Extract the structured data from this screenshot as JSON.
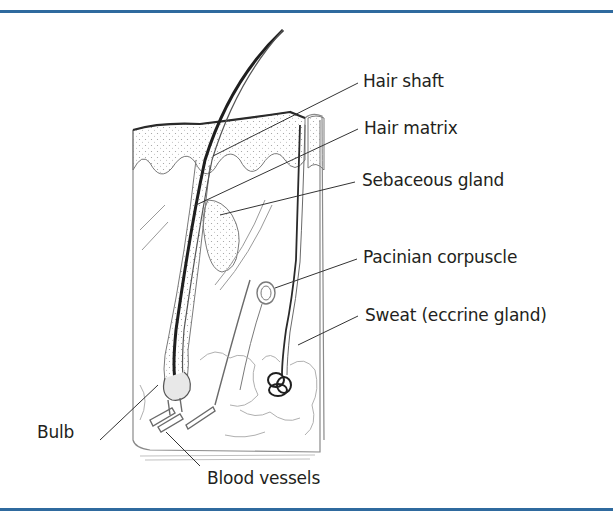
{
  "figure": {
    "type": "anatomical-diagram",
    "frame_color": "#2f6a9e",
    "labels": [
      {
        "id": "hair-shaft",
        "text": "Hair shaft"
      },
      {
        "id": "hair-matrix",
        "text": "Hair matrix"
      },
      {
        "id": "sebaceous-gland",
        "text": "Sebaceous gland"
      },
      {
        "id": "pacinian-corpuscle",
        "text": "Pacinian corpuscle"
      },
      {
        "id": "sweat-gland",
        "text": "Sweat (eccrine gland)"
      },
      {
        "id": "bulb",
        "text": "Bulb"
      },
      {
        "id": "blood-vessels",
        "text": "Blood vessels"
      }
    ]
  }
}
